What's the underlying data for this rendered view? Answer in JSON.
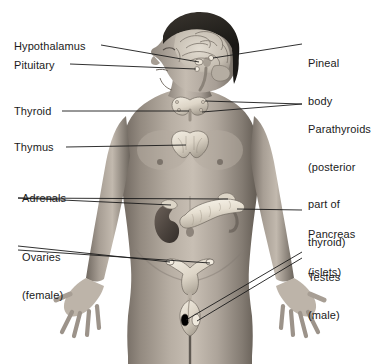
{
  "figure": {
    "background_color": "#ffffff",
    "width": 380,
    "height": 364,
    "text_color": "#1b1b1b",
    "leader_line_color": "#1a1a1a"
  },
  "subject": {
    "description": "Front view of a human body with head in left profile, arms at sides with open hands, cropped at mid-thigh",
    "skin_tone": "#9a9188",
    "organ_tone": "#e8e2d6"
  },
  "labels_left": [
    {
      "id": "hypothalamus",
      "text": "Hypothalamus",
      "x": 14,
      "y": 38,
      "lines": [
        "Hypothalamus"
      ]
    },
    {
      "id": "pituitary",
      "text": "Pituitary",
      "x": 14,
      "y": 58,
      "lines": [
        "Pituitary"
      ]
    },
    {
      "id": "thyroid",
      "text": "Thyroid",
      "x": 14,
      "y": 104,
      "lines": [
        "Thyroid"
      ]
    },
    {
      "id": "thymus",
      "text": "Thymus",
      "x": 14,
      "y": 140,
      "lines": [
        "Thymus"
      ]
    },
    {
      "id": "adrenals",
      "text": "Adrenals",
      "x": 22,
      "y": 186,
      "lines": [
        "Adrenals"
      ]
    },
    {
      "id": "ovaries",
      "text": "Ovaries (female)",
      "x": 22,
      "y": 222,
      "lines": [
        "Ovaries",
        "(female)"
      ]
    }
  ],
  "labels_right": [
    {
      "id": "pineal-body",
      "text": "Pineal body",
      "x": 308,
      "y": 32,
      "lines": [
        "Pineal",
        "body"
      ]
    },
    {
      "id": "parathyroids",
      "text": "Parathyroids (posterior part of thyroid)",
      "x": 308,
      "y": 99,
      "lines": [
        "Parathyroids",
        "(posterior",
        "part of",
        "thyroid)"
      ]
    },
    {
      "id": "pancreas",
      "text": "Pancreas (islets)",
      "x": 308,
      "y": 198,
      "lines": [
        "Pancreas",
        "(islets)"
      ]
    },
    {
      "id": "testes",
      "text": "Testes (male)",
      "x": 308,
      "y": 244,
      "lines": [
        "Testes",
        "(male)"
      ]
    }
  ],
  "glands": [
    {
      "id": "pineal",
      "name": "Pineal body",
      "region": "brain, center"
    },
    {
      "id": "hypothalamus",
      "name": "Hypothalamus",
      "region": "brain, lower center"
    },
    {
      "id": "pituitary",
      "name": "Pituitary",
      "region": "brain, base"
    },
    {
      "id": "thyroid",
      "name": "Thyroid",
      "region": "neck, butterfly shape"
    },
    {
      "id": "parathyroids",
      "name": "Parathyroids",
      "region": "posterior thyroid"
    },
    {
      "id": "thymus",
      "name": "Thymus",
      "region": "upper chest"
    },
    {
      "id": "adrenals",
      "name": "Adrenals",
      "region": "atop kidneys"
    },
    {
      "id": "pancreas",
      "name": "Pancreas (islets)",
      "region": "upper abdomen"
    },
    {
      "id": "ovaries",
      "name": "Ovaries",
      "region": "pelvis, female"
    },
    {
      "id": "testes",
      "name": "Testes",
      "region": "pelvis, male"
    }
  ]
}
